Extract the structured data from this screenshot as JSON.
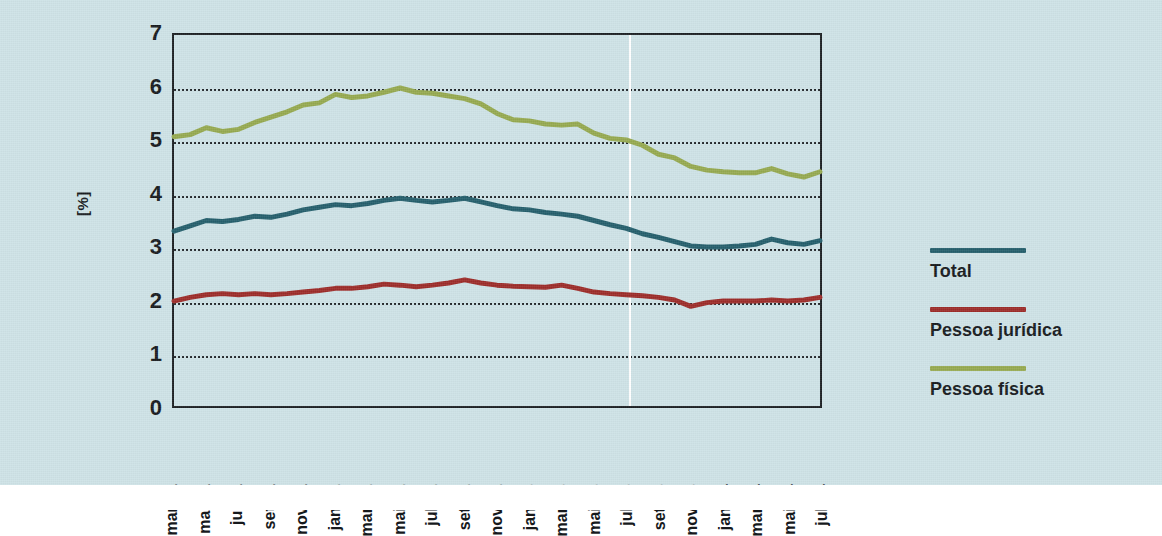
{
  "figure": {
    "background_color": "#cde2e6",
    "plot_border_color": "#1b1f22"
  },
  "axis": {
    "y_title": "[%]",
    "y_ticks": [
      "0",
      "1",
      "2",
      "3",
      "4",
      "5",
      "6",
      "7"
    ]
  },
  "legend": {
    "entries": [
      {
        "label": "Total",
        "color": "#235e6b",
        "name": "legend-total"
      },
      {
        "label": "Pessoa jurídica",
        "color": "#9c2b28",
        "name": "legend-pessoa-juridica"
      },
      {
        "label": "Pessoa física",
        "color": "#95a94f",
        "name": "legend-pessoa-fisica"
      }
    ]
  },
  "chart_data": {
    "type": "line",
    "title": "",
    "xlabel": "",
    "ylabel": "[%]",
    "ylim": [
      0,
      7
    ],
    "grid": true,
    "grid_values": [
      1,
      2,
      3,
      4,
      5,
      6
    ],
    "legend_position": "right",
    "annotations": [
      {
        "type": "vertical-line",
        "x": "jul-13",
        "color": "#ffffff"
      }
    ],
    "x": [
      "mar-11",
      "abr-11",
      "mai-11",
      "jun-11",
      "jul-11",
      "ago-11",
      "set-11",
      "out-11",
      "nov-11",
      "dez-11",
      "jan-12",
      "fev-12",
      "mar-12",
      "abr-12",
      "mai-12",
      "jun-12",
      "jul-12",
      "ago-12",
      "set-12",
      "out-12",
      "nov-12",
      "dez-12",
      "jan-13",
      "fev-13",
      "mar-13",
      "abr-13",
      "mai-13",
      "jun-13",
      "jul-13",
      "ago-13",
      "set-13",
      "out-13",
      "nov-13",
      "dez-13",
      "jan-14",
      "fev-14",
      "mar-14",
      "abr-14",
      "mai-14",
      "jun-14",
      "jul-14"
    ],
    "tick_labels": [
      "mar-11",
      "mai-11",
      "jul-11",
      "set-11",
      "nov-11",
      "jan-12",
      "mar-12",
      "mai-12",
      "jul-12",
      "set-12",
      "nov-12",
      "jan-13",
      "mar-13",
      "mai-13",
      "jul-13",
      "set-13",
      "nov-13",
      "jan-14",
      "mar-14",
      "mai-14",
      "jul-14"
    ],
    "series": [
      {
        "name": "Total",
        "color": "#235e6b",
        "values": [
          3.3,
          3.4,
          3.5,
          3.48,
          3.52,
          3.58,
          3.56,
          3.62,
          3.7,
          3.75,
          3.8,
          3.78,
          3.82,
          3.88,
          3.92,
          3.88,
          3.85,
          3.88,
          3.92,
          3.85,
          3.78,
          3.72,
          3.7,
          3.65,
          3.62,
          3.58,
          3.5,
          3.42,
          3.35,
          3.25,
          3.18,
          3.1,
          3.02,
          3.0,
          3.0,
          3.02,
          3.05,
          3.15,
          3.08,
          3.05,
          3.12
        ]
      },
      {
        "name": "Pessoa jurídica",
        "color": "#9c2b28",
        "values": [
          1.98,
          2.05,
          2.1,
          2.12,
          2.1,
          2.12,
          2.1,
          2.12,
          2.15,
          2.18,
          2.22,
          2.22,
          2.25,
          2.3,
          2.28,
          2.25,
          2.28,
          2.32,
          2.38,
          2.32,
          2.28,
          2.26,
          2.25,
          2.24,
          2.28,
          2.22,
          2.15,
          2.12,
          2.1,
          2.08,
          2.05,
          2.0,
          1.88,
          1.95,
          1.98,
          1.98,
          1.98,
          2.0,
          1.98,
          2.0,
          2.05
        ]
      },
      {
        "name": "Pessoa física",
        "color": "#95a94f",
        "values": [
          5.08,
          5.12,
          5.25,
          5.18,
          5.22,
          5.35,
          5.45,
          5.55,
          5.68,
          5.72,
          5.88,
          5.82,
          5.85,
          5.92,
          6.0,
          5.92,
          5.9,
          5.85,
          5.8,
          5.7,
          5.52,
          5.4,
          5.38,
          5.32,
          5.3,
          5.32,
          5.15,
          5.05,
          5.02,
          4.92,
          4.75,
          4.68,
          4.52,
          4.45,
          4.42,
          4.4,
          4.4,
          4.48,
          4.38,
          4.32,
          4.42
        ]
      }
    ]
  }
}
